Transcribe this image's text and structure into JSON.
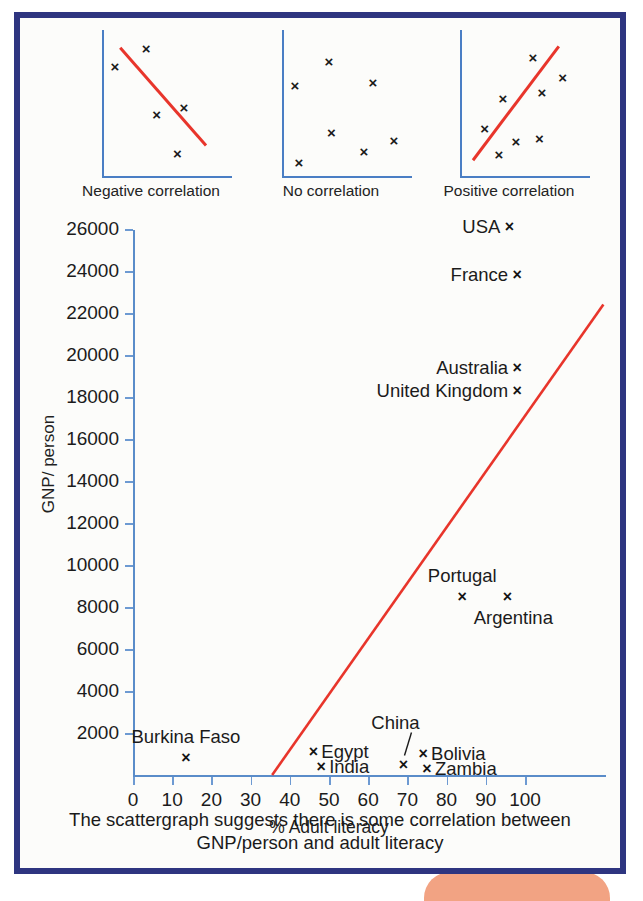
{
  "figure": {
    "frame_color": "#2e3580",
    "accent_line_color": "#e8352b",
    "axis_color": "#5a8cc9",
    "background": "#fcfcfa",
    "decorative_blob_color": "#f2a383"
  },
  "mini_charts": [
    {
      "caption": "Negative correlation",
      "has_trend_line": true,
      "trend": {
        "x1": 0.14,
        "y1": 0.88,
        "x2": 0.8,
        "y2": 0.22
      },
      "points": [
        {
          "x": 0.1,
          "y": 0.76
        },
        {
          "x": 0.34,
          "y": 0.88
        },
        {
          "x": 0.42,
          "y": 0.43
        },
        {
          "x": 0.63,
          "y": 0.48
        },
        {
          "x": 0.58,
          "y": 0.17
        }
      ]
    },
    {
      "caption": "No correlation",
      "has_trend_line": false,
      "points": [
        {
          "x": 0.1,
          "y": 0.63
        },
        {
          "x": 0.36,
          "y": 0.79
        },
        {
          "x": 0.7,
          "y": 0.65
        },
        {
          "x": 0.38,
          "y": 0.31
        },
        {
          "x": 0.13,
          "y": 0.11
        },
        {
          "x": 0.63,
          "y": 0.18
        },
        {
          "x": 0.86,
          "y": 0.26
        }
      ]
    },
    {
      "caption": "Positive correlation",
      "has_trend_line": true,
      "trend": {
        "x1": 0.1,
        "y1": 0.12,
        "x2": 0.76,
        "y2": 0.89
      },
      "points": [
        {
          "x": 0.19,
          "y": 0.34
        },
        {
          "x": 0.33,
          "y": 0.54
        },
        {
          "x": 0.56,
          "y": 0.82
        },
        {
          "x": 0.63,
          "y": 0.58
        },
        {
          "x": 0.79,
          "y": 0.68
        },
        {
          "x": 0.3,
          "y": 0.16
        },
        {
          "x": 0.43,
          "y": 0.25
        },
        {
          "x": 0.61,
          "y": 0.27
        }
      ]
    }
  ],
  "chart_data": {
    "type": "scatter",
    "title": "",
    "xlabel": "% Adult literacy",
    "ylabel": "GNP/ person",
    "xlim": [
      0,
      120
    ],
    "ylim": [
      0,
      27000
    ],
    "xticks": [
      0,
      10,
      20,
      30,
      40,
      50,
      60,
      70,
      80,
      90,
      100
    ],
    "yticks": [
      2000,
      4000,
      6000,
      8000,
      10000,
      12000,
      14000,
      16000,
      18000,
      20000,
      22000,
      24000,
      26000
    ],
    "grid": false,
    "legend": "none",
    "trend_line": {
      "label": "line of best fit",
      "color": "#e8352b",
      "x_start": 35.5,
      "y_start": 0,
      "x_end": 120,
      "y_end": 22400
    },
    "points": [
      {
        "label": "USA",
        "x": 96,
        "y": 26100,
        "label_side": "left"
      },
      {
        "label": "France",
        "x": 98,
        "y": 23800,
        "label_side": "left"
      },
      {
        "label": "Australia",
        "x": 98,
        "y": 19400,
        "label_side": "left"
      },
      {
        "label": "United Kingdom",
        "x": 98,
        "y": 18300,
        "label_side": "left"
      },
      {
        "label": "Portugal",
        "x": 84,
        "y": 8500,
        "label_side": "above"
      },
      {
        "label": "Argentina",
        "x": 95.5,
        "y": 8500,
        "label_side": "below"
      },
      {
        "label": "Burkina Faso",
        "x": 13.5,
        "y": 800,
        "label_side": "above"
      },
      {
        "label": "Egypt",
        "x": 46,
        "y": 1100,
        "label_side": "right"
      },
      {
        "label": "India",
        "x": 48,
        "y": 400,
        "label_side": "right"
      },
      {
        "label": "China",
        "x": 69,
        "y": 500,
        "label_side": "leader"
      },
      {
        "label": "Bolivia",
        "x": 74,
        "y": 1000,
        "label_side": "right"
      },
      {
        "label": "Zambia",
        "x": 75,
        "y": 300,
        "label_side": "right"
      }
    ]
  },
  "caption": {
    "line1": "The scattergraph suggests there is some correlation between",
    "line2": "GNP/person and adult literacy"
  },
  "marker_glyph": "×"
}
